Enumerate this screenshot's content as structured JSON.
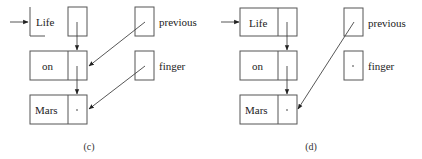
{
  "panels": [
    {
      "caption": "(c)",
      "nodes": [
        "Life",
        "on",
        "Mars"
      ],
      "pointers": [
        "previous",
        "finger"
      ],
      "head_node_partial": true,
      "previous_points_to": "on",
      "finger_points_to": "Mars",
      "finger_null": false
    },
    {
      "caption": "(d)",
      "nodes": [
        "Life",
        "on",
        "Mars"
      ],
      "pointers": [
        "previous",
        "finger"
      ],
      "head_node_partial": false,
      "previous_points_to": "Mars",
      "finger_points_to": null,
      "finger_null": true
    }
  ],
  "null_marker": "·"
}
